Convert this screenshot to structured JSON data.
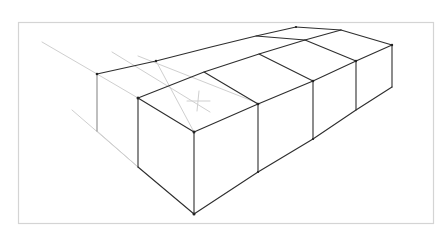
{
  "drawing": {
    "subject": "perspective-sketch-of-cubes",
    "colors": {
      "background": "#ffffff",
      "frame": "#d4d4d4",
      "ink": "#2e2e2e",
      "construction": "#cfcfcf"
    },
    "frame": {
      "x": 18,
      "y": 22,
      "width": 415,
      "height": 201
    }
  }
}
